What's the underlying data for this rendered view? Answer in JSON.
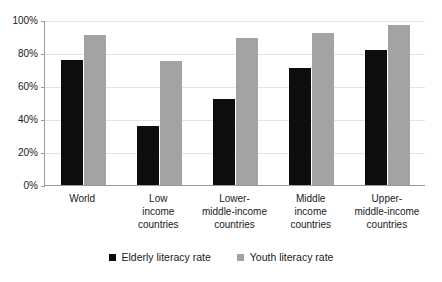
{
  "chart_data": {
    "type": "bar",
    "title": "",
    "subtitle": "",
    "xlabel": "",
    "ylabel": "",
    "ylim": [
      0,
      100
    ],
    "yticks": [
      "0%",
      "20%",
      "40%",
      "60%",
      "80%",
      "100%"
    ],
    "ytick_values": [
      0,
      20,
      40,
      60,
      80,
      100
    ],
    "grid": true,
    "legend_position": "bottom",
    "categories": [
      "World",
      "Low income countries",
      "Lower-middle-income countries",
      "Middle income countries",
      "Upper-middle-income countries"
    ],
    "category_label_lines": [
      [
        "World"
      ],
      [
        "Low",
        "income",
        "countries"
      ],
      [
        "Lower-",
        "middle-income",
        "countries"
      ],
      [
        "Middle",
        "income",
        "countries"
      ],
      [
        "Upper-",
        "middle-income",
        "countries"
      ]
    ],
    "series": [
      {
        "name": "Elderly literacy rate",
        "color": "#0d0d0d",
        "values": [
          76,
          36,
          52,
          71,
          82
        ]
      },
      {
        "name": "Youth literacy rate",
        "color": "#a3a3a3",
        "values": [
          91,
          75,
          89,
          92,
          97
        ]
      }
    ]
  },
  "legend": {
    "items": [
      {
        "label": "Elderly literacy rate",
        "swatch": "elderly"
      },
      {
        "label": "Youth literacy rate",
        "swatch": "youth"
      }
    ]
  },
  "colors": {
    "elderly": "#0d0d0d",
    "youth": "#a3a3a3",
    "gridline": "#e3e3e3",
    "axis": "#9a9a9a",
    "text": "#1a1a1a",
    "background": "#ffffff"
  }
}
